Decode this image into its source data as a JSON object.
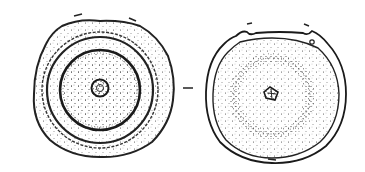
{
  "figure": {
    "type": "line-drawing illustration",
    "panels": [
      {
        "id": "left",
        "label": "disc with concentric rings and central boss"
      },
      {
        "id": "right",
        "label": "disc with stippled surface, rim and central mark"
      }
    ],
    "separator": "–",
    "colors": {
      "ink": "#222222",
      "background": "#ffffff"
    }
  }
}
